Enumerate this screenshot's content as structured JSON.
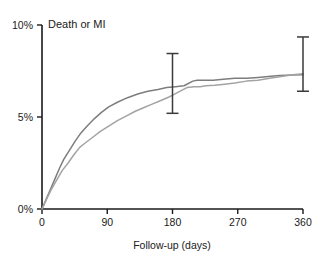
{
  "chart_data": {
    "type": "line",
    "title": "Death or MI",
    "xlabel": "Follow-up (days)",
    "ylabel": "",
    "xlim": [
      0,
      360
    ],
    "ylim": [
      0,
      10
    ],
    "grid": false,
    "legend_position": "none",
    "x_ticks": [
      0,
      90,
      180,
      270,
      360
    ],
    "x_tick_labels": [
      "0",
      "90",
      "180",
      "270",
      "360"
    ],
    "y_ticks": [
      0,
      5,
      10
    ],
    "y_tick_labels": [
      "0%",
      "5%",
      "10%"
    ],
    "series": [
      {
        "name": "curve-upper",
        "color": "#7d7d7d",
        "x": [
          0,
          6,
          12,
          18,
          24,
          30,
          38,
          46,
          54,
          62,
          72,
          82,
          92,
          104,
          118,
          132,
          146,
          160,
          172,
          184,
          196,
          208,
          214,
          222,
          236,
          250,
          266,
          282,
          298,
          312,
          328,
          344,
          360
        ],
        "y": [
          0.0,
          0.55,
          1.1,
          1.65,
          2.2,
          2.7,
          3.2,
          3.7,
          4.15,
          4.5,
          4.9,
          5.25,
          5.55,
          5.8,
          6.05,
          6.25,
          6.4,
          6.5,
          6.6,
          6.65,
          6.7,
          6.95,
          7.0,
          7.0,
          7.0,
          7.05,
          7.1,
          7.1,
          7.15,
          7.2,
          7.25,
          7.28,
          7.3
        ]
      },
      {
        "name": "curve-lower",
        "color": "#a3a3a3",
        "x": [
          0,
          6,
          12,
          20,
          28,
          36,
          44,
          52,
          60,
          70,
          80,
          92,
          104,
          116,
          128,
          140,
          152,
          164,
          176,
          188,
          200,
          210,
          218,
          226,
          238,
          252,
          266,
          282,
          298,
          314,
          330,
          346,
          360
        ],
        "y": [
          0.0,
          0.5,
          1.0,
          1.55,
          2.1,
          2.5,
          2.95,
          3.35,
          3.6,
          3.9,
          4.2,
          4.5,
          4.8,
          5.05,
          5.3,
          5.5,
          5.7,
          5.9,
          6.1,
          6.35,
          6.6,
          6.65,
          6.65,
          6.7,
          6.72,
          6.78,
          6.85,
          6.95,
          7.0,
          7.1,
          7.2,
          7.3,
          7.35
        ]
      }
    ],
    "error_bars": [
      {
        "name": "error-bar-180",
        "x": 180,
        "center": 6.7,
        "low": 5.2,
        "high": 8.45
      },
      {
        "name": "error-bar-360",
        "x": 360,
        "center": 7.3,
        "low": 6.4,
        "high": 9.35
      }
    ],
    "axis_color": "#1a1a1a"
  }
}
